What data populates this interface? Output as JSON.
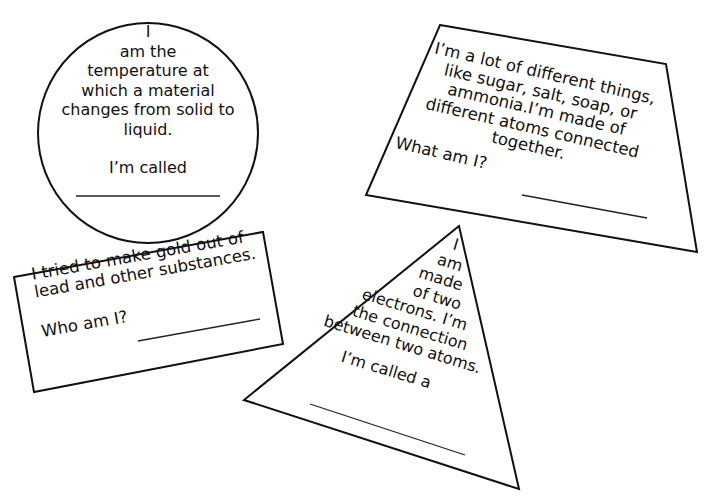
{
  "colors": {
    "ink": "#111111",
    "background": "#ffffff"
  },
  "cards": {
    "circle": {
      "lines": [
        "I",
        "am the",
        "temperature at",
        "which a material",
        "changes from solid to",
        "liquid."
      ],
      "prompt": "I’m called",
      "answer_blank": ""
    },
    "rectangle": {
      "lines": [
        "I tried to make gold out of",
        "lead and other substances."
      ],
      "prompt": "Who am I?",
      "answer_blank": ""
    },
    "trapezoid": {
      "lines": [
        "I’m a lot of different things,",
        "like sugar, salt, soap, or",
        "ammonia.I’m made of",
        "different atoms connected",
        "together."
      ],
      "prompt": "What am I?",
      "answer_blank": ""
    },
    "triangle": {
      "lines": [
        "I",
        "am",
        "made",
        "of two",
        "electrons. I’m",
        "the connection",
        "between two atoms."
      ],
      "prompt": "I’m called a",
      "answer_blank": ""
    }
  }
}
